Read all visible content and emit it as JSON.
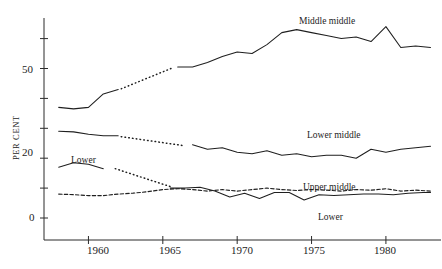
{
  "axes": {
    "ylabel": "PER CENT",
    "y_ticks_labeled": [
      "0",
      "20",
      "50"
    ],
    "y_tick_values": [
      0,
      10,
      20,
      30,
      40,
      50,
      60,
      70
    ],
    "x_ticks": [
      "1960",
      "1965",
      "1970",
      "1975",
      "1980"
    ]
  },
  "series_labels": {
    "middle_middle": "Middle middle",
    "lower_middle": "Lower middle",
    "upper_middle": "Upper middle",
    "lower_right": "Lower",
    "lower_left": "Lower"
  },
  "chart_data": {
    "type": "line",
    "title": "",
    "xlabel": "",
    "ylabel": "PER CENT",
    "xlim": [
      1958,
      1983.3
    ],
    "ylim": [
      0,
      72
    ],
    "grid": false,
    "legend": "inline-annotations",
    "xticks": [
      1960,
      1965,
      1970,
      1975,
      1980
    ],
    "yticks": [
      0,
      10,
      20,
      30,
      40,
      50,
      60,
      70
    ],
    "ytick_labels": {
      "0": "0",
      "20": "20",
      "50": "50"
    },
    "series": [
      {
        "name": "Middle middle",
        "style": "solid-with-dotted-gap",
        "x": [
          1958.0,
          1959.0,
          1960.0,
          1961.0,
          1962.0,
          1963.0,
          1964.0,
          1965.0,
          1966.0,
          1967.0,
          1968.0,
          1969.0,
          1970.0,
          1971.0,
          1972.0,
          1973.0,
          1974.0,
          1975.0,
          1976.0,
          1977.0,
          1978.0,
          1979.0,
          1980.0,
          1981.0,
          1982.0,
          1983.0
        ],
        "values": [
          37.0,
          36.5,
          37.0,
          41.5,
          43.0,
          44.0,
          46.5,
          49.5,
          50.5,
          50.5,
          52.0,
          54.0,
          55.5,
          55.0,
          58.0,
          62.0,
          63.0,
          62.0,
          61.0,
          60.0,
          60.5,
          59.0,
          64.0,
          57.0,
          57.5,
          57.0
        ],
        "dotted_segment_x": [
          1962.2,
          1965.6
        ],
        "notes": "Solid 1958-1962, dotted interpolation 1962-1965.6, solid thereafter"
      },
      {
        "name": "Lower middle",
        "style": "solid-with-dotted-gap",
        "x": [
          1958.0,
          1959.0,
          1960.0,
          1961.0,
          1962.0,
          1963.0,
          1964.0,
          1965.0,
          1966.0,
          1967.0,
          1968.0,
          1969.0,
          1970.0,
          1971.0,
          1972.0,
          1973.0,
          1974.0,
          1975.0,
          1976.0,
          1977.0,
          1978.0,
          1979.0,
          1980.0,
          1981.0,
          1982.0,
          1983.0
        ],
        "values": [
          29.0,
          28.8,
          28.0,
          27.5,
          27.5,
          26.0,
          25.0,
          24.5,
          24.0,
          24.5,
          23.0,
          23.5,
          22.0,
          21.5,
          22.5,
          21.0,
          21.5,
          20.5,
          21.0,
          21.0,
          20.0,
          23.0,
          22.0,
          23.0,
          23.5,
          24.0
        ],
        "dotted_segment_x": [
          1962.2,
          1966.4
        ],
        "notes": "Solid 1958-1962, dotted interpolation, solid from ~1966.4"
      },
      {
        "name": "Upper middle",
        "style": "dashed",
        "x": [
          1958.0,
          1959.0,
          1960.0,
          1961.0,
          1962.0,
          1963.0,
          1964.0,
          1965.0,
          1966.0,
          1967.0,
          1968.0,
          1969.0,
          1970.0,
          1971.0,
          1972.0,
          1973.0,
          1974.0,
          1975.0,
          1976.0,
          1977.0,
          1978.0,
          1979.0,
          1980.0,
          1981.0,
          1982.0,
          1983.0
        ],
        "values": [
          8.0,
          7.8,
          7.5,
          7.5,
          8.0,
          8.3,
          8.8,
          9.5,
          9.8,
          9.5,
          9.0,
          9.5,
          9.0,
          9.5,
          10.0,
          9.5,
          9.2,
          9.5,
          9.3,
          9.0,
          9.5,
          9.3,
          9.8,
          9.0,
          9.3,
          9.0
        ]
      },
      {
        "name": "Lower",
        "style": "solid-right",
        "x": [
          1965.5,
          1966.5,
          1967.5,
          1968.5,
          1969.5,
          1970.5,
          1971.5,
          1972.5,
          1973.5,
          1974.5,
          1975.5,
          1976.5,
          1977.5,
          1978.5,
          1979.5,
          1980.5,
          1981.5,
          1982.5,
          1983.0
        ],
        "values": [
          10.0,
          10.0,
          10.3,
          9.0,
          7.0,
          8.3,
          6.5,
          8.5,
          8.5,
          6.0,
          7.8,
          7.5,
          7.8,
          8.0,
          8.0,
          7.8,
          8.3,
          8.5,
          8.5
        ],
        "notes": "Solid line starting mid-1960s, below the dashed Upper middle"
      },
      {
        "name": "Lower (early)",
        "style": "solid-with-dotted-gap",
        "x": [
          1958.0,
          1959.0,
          1960.0,
          1961.0,
          1962.0,
          1963.0,
          1964.0,
          1965.0
        ],
        "values": [
          17.0,
          18.5,
          18.0,
          16.5,
          16.5,
          15.0,
          13.0,
          10.5
        ],
        "dotted_segment_x": [
          1961.8,
          1965.5
        ],
        "notes": "Left 'Lower' branch: solid then dotted descending to join lower cluster"
      }
    ]
  }
}
